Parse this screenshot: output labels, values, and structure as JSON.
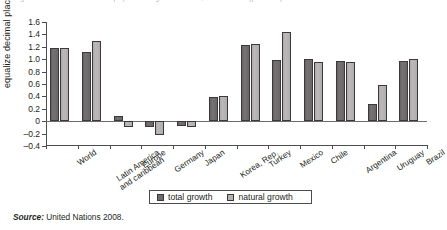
{
  "figure": {
    "title_sliver": "igure 1.  Total and natural population growth rates, 2005-2010 (percent)",
    "source_prefix": "Source:",
    "source_text": "United Nations 2008."
  },
  "legend": {
    "position": "bottom-center",
    "items": [
      {
        "label": "total growth",
        "color": "#6e6a6b",
        "key": "total"
      },
      {
        "label": "natural growth",
        "color": "#b3b0af",
        "key": "natural"
      }
    ]
  },
  "chart_data": {
    "type": "bar",
    "title": "",
    "xlabel": "",
    "ylabel": "equalize decimal places",
    "ylim": [
      -0.4,
      1.6
    ],
    "ytick_step": 0.2,
    "grid": false,
    "yticks": [
      "1.6",
      "1.4",
      "1.2",
      "1.0",
      "0.8",
      "0.6",
      "0.4",
      "0.2",
      "0",
      "–0.2",
      "–0.4"
    ],
    "ytick_values": [
      1.6,
      1.4,
      1.2,
      1.0,
      0.8,
      0.6,
      0.4,
      0.2,
      0,
      -0.2,
      -0.4
    ],
    "categories": [
      "World",
      "Latin America\nand caribbean",
      "Europe",
      "Germany",
      "Japan",
      "Korea, Rep.",
      "Turkey",
      "Mexico",
      "Chile",
      "Argentina",
      "Uruguay",
      "Brazil"
    ],
    "category_lines": [
      [
        "World"
      ],
      [
        "Latin America",
        "and caribbean"
      ],
      [
        "Europe"
      ],
      [
        "Germany"
      ],
      [
        "Japan"
      ],
      [
        "Korea, Rep."
      ],
      [
        "Turkey"
      ],
      [
        "Mexico"
      ],
      [
        "Chile"
      ],
      [
        "Argentina"
      ],
      [
        "Uruguay"
      ],
      [
        "Brazil"
      ]
    ],
    "series": [
      {
        "name": "total growth",
        "color": "#6e6a6b",
        "values": [
          1.18,
          1.12,
          0.08,
          -0.1,
          -0.08,
          0.39,
          1.23,
          0.99,
          1.0,
          0.97,
          0.28,
          0.97
        ]
      },
      {
        "name": "natural growth",
        "color": "#b3b0af",
        "values": [
          1.18,
          1.3,
          -0.09,
          -0.23,
          -0.09,
          0.4,
          1.24,
          1.44,
          0.96,
          0.96,
          0.58,
          1.0
        ]
      }
    ]
  }
}
